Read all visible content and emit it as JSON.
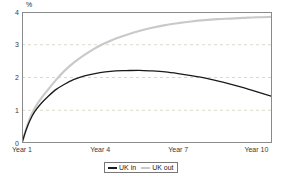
{
  "chart_data": {
    "type": "line",
    "title": "",
    "subtitle": "",
    "xlabel": "",
    "ylabel": "%",
    "unit_label": "%",
    "xlim": [
      1,
      10.6
    ],
    "ylim": [
      0,
      4
    ],
    "yticks": [
      0,
      1,
      2,
      3,
      4
    ],
    "ytick_labels": [
      "0",
      "1",
      "2",
      "3",
      "4"
    ],
    "xticks": [
      1,
      4,
      7,
      10
    ],
    "xtick_labels": [
      "Year 1",
      "Year 4",
      "Year 7",
      "Year 10"
    ],
    "grid": "horizontal-dashed",
    "legend_position": "bottom-center",
    "x": [
      1.0,
      1.15,
      1.3,
      1.5,
      1.75,
      2.0,
      2.3,
      2.6,
      3.0,
      3.4,
      3.8,
      4.2,
      4.6,
      5.0,
      5.5,
      6.0,
      6.5,
      7.0,
      7.5,
      8.0,
      8.5,
      9.0,
      9.5,
      10.0,
      10.6
    ],
    "series": [
      {
        "name": "UK in",
        "color": "#1a1a1a",
        "values": [
          0.0,
          0.38,
          0.68,
          0.97,
          1.22,
          1.42,
          1.63,
          1.78,
          1.94,
          2.05,
          2.12,
          2.17,
          2.2,
          2.21,
          2.22,
          2.2,
          2.17,
          2.12,
          2.06,
          1.99,
          1.9,
          1.8,
          1.69,
          1.57,
          1.42
        ]
      },
      {
        "name": "UK out",
        "color": "#c9c9c9",
        "values": [
          0.0,
          0.4,
          0.74,
          1.08,
          1.38,
          1.63,
          1.92,
          2.18,
          2.46,
          2.69,
          2.89,
          3.05,
          3.19,
          3.3,
          3.42,
          3.52,
          3.6,
          3.66,
          3.71,
          3.75,
          3.78,
          3.8,
          3.82,
          3.84,
          3.85
        ]
      }
    ]
  },
  "legend": {
    "items": [
      {
        "label": "UK in",
        "color": "#1a1a1a"
      },
      {
        "label": "UK out",
        "color": "#c9c9c9"
      }
    ]
  }
}
